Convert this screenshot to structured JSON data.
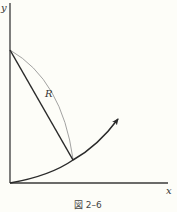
{
  "figure": {
    "caption": "図 2–6",
    "axes": {
      "x_label": "x",
      "y_label": "y"
    },
    "labels": {
      "radius": "R"
    },
    "colors": {
      "axis": "#3a3a3a",
      "thick_line": "#2a2a2a",
      "thin_arc": "#8a8a8a",
      "background": "#fdfdf8"
    },
    "elements": [
      {
        "name": "y-axis",
        "type": "line"
      },
      {
        "name": "x-axis",
        "type": "line"
      },
      {
        "name": "radius-segment",
        "type": "line",
        "label": "R"
      },
      {
        "name": "circular-arc",
        "type": "arc"
      },
      {
        "name": "trajectory-curve",
        "type": "curve",
        "arrow": true
      }
    ]
  }
}
